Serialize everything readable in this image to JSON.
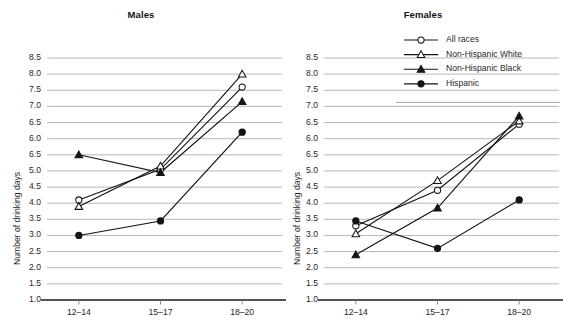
{
  "panels": [
    {
      "title": "Males"
    },
    {
      "title": "Females"
    }
  ],
  "axes": {
    "ylabel": "Number of drinking days",
    "yticks": [
      "8.5",
      "8.0",
      "7.5",
      "7.0",
      "6.5",
      "6.0",
      "6.5",
      "5.0",
      "4.5",
      "4.0",
      "3.5",
      "3.0",
      "2.5",
      "2.0",
      "1.5",
      "1.0"
    ],
    "xticks": [
      "12–14",
      "15–17",
      "18–20"
    ]
  },
  "legend": {
    "items": [
      {
        "label": "All races",
        "marker": "open-circle"
      },
      {
        "label": "Non-Hispanic White",
        "marker": "open-triangle"
      },
      {
        "label": "Non-Hispanic Black",
        "marker": "filled-triangle"
      },
      {
        "label": "Hispanic",
        "marker": "filled-circle"
      }
    ]
  },
  "chart_data": [
    {
      "type": "line",
      "title": "Males",
      "xlabel": "",
      "ylabel": "Number of drinking days",
      "categories": [
        "12–14",
        "15–17",
        "18–20"
      ],
      "ylim": [
        1.0,
        8.5
      ],
      "ytick_values": [
        8.5,
        8.0,
        7.5,
        7.0,
        6.5,
        6.0,
        5.5,
        5.0,
        4.5,
        4.0,
        3.5,
        3.0,
        2.5,
        2.0,
        1.5,
        1.0
      ],
      "ytick_labels": [
        "8.5",
        "8.0",
        "7.5",
        "7.0",
        "6.5",
        "6.0",
        "6.5",
        "5.0",
        "4.5",
        "4.0",
        "3.5",
        "3.0",
        "2.5",
        "2.0",
        "1.5",
        "1.0"
      ],
      "grid": true,
      "legend_position": "top-right-shared",
      "series": [
        {
          "name": "All races",
          "marker": "open-circle",
          "values": [
            4.1,
            5.05,
            7.6
          ]
        },
        {
          "name": "Non-Hispanic White",
          "marker": "open-triangle",
          "values": [
            3.9,
            5.15,
            8.0
          ]
        },
        {
          "name": "Non-Hispanic Black",
          "marker": "filled-triangle",
          "values": [
            5.5,
            4.95,
            7.15
          ]
        },
        {
          "name": "Hispanic",
          "marker": "filled-circle",
          "values": [
            3.0,
            3.45,
            6.2
          ]
        }
      ]
    },
    {
      "type": "line",
      "title": "Females",
      "xlabel": "",
      "ylabel": "Number of drinking days",
      "categories": [
        "12–14",
        "15–17",
        "18–20"
      ],
      "ylim": [
        1.0,
        8.5
      ],
      "ytick_values": [
        8.5,
        8.0,
        7.5,
        7.0,
        6.5,
        6.0,
        5.5,
        5.0,
        4.5,
        4.0,
        3.5,
        3.0,
        2.5,
        2.0,
        1.5,
        1.0
      ],
      "ytick_labels": [
        "8.5",
        "8.0",
        "7.5",
        "7.0",
        "6.5",
        "6.0",
        "6.5",
        "5.0",
        "4.5",
        "4.0",
        "3.5",
        "3.0",
        "2.5",
        "2.0",
        "1.5",
        "1.0"
      ],
      "grid": true,
      "legend_position": "top-right-shared",
      "series": [
        {
          "name": "All races",
          "marker": "open-circle",
          "values": [
            3.3,
            4.4,
            6.45
          ]
        },
        {
          "name": "Non-Hispanic White",
          "marker": "open-triangle",
          "values": [
            3.05,
            4.7,
            6.55
          ]
        },
        {
          "name": "Non-Hispanic Black",
          "marker": "filled-triangle",
          "values": [
            2.4,
            3.85,
            6.7
          ]
        },
        {
          "name": "Hispanic",
          "marker": "filled-circle",
          "values": [
            3.45,
            2.6,
            4.1
          ]
        }
      ]
    }
  ]
}
